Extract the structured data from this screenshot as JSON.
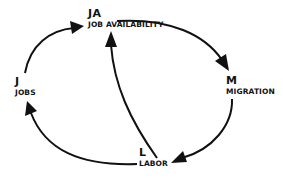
{
  "diagram": {
    "type": "causal-loop",
    "nodes": [
      {
        "id": "JA",
        "abbr": "JA",
        "label": "JOB AVAILABILITY"
      },
      {
        "id": "J",
        "abbr": "J",
        "label": "JOBS"
      },
      {
        "id": "M",
        "abbr": "M",
        "label": "MIGRATION"
      },
      {
        "id": "L",
        "abbr": "L",
        "label": "LABOR"
      }
    ],
    "edges": [
      {
        "from": "J",
        "to": "JA"
      },
      {
        "from": "JA",
        "to": "M"
      },
      {
        "from": "M",
        "to": "L"
      },
      {
        "from": "L",
        "to": "J"
      },
      {
        "from": "L",
        "to": "JA"
      }
    ],
    "colors": {
      "stroke": "#111111",
      "background": "#ffffff"
    }
  }
}
